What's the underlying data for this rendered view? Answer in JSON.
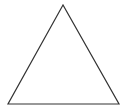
{
  "diagram": {
    "shape": "triangle",
    "type": "equilateral-outline",
    "vertices": {
      "apex": [
        63,
        5
      ],
      "bottom_left": [
        8,
        104
      ],
      "bottom_right": [
        119,
        104
      ]
    },
    "stroke_color": "#333333",
    "fill_color": "#ffffff",
    "stroke_width": 1.2
  }
}
